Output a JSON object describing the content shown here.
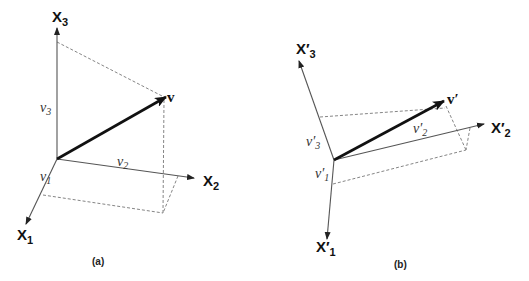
{
  "panel_a": {
    "caption": "(a)",
    "axes": {
      "x1": {
        "base": "X",
        "sub": "1"
      },
      "x2": {
        "base": "X",
        "sub": "2"
      },
      "x3": {
        "base": "X",
        "sub": "3"
      }
    },
    "vector": {
      "label": "v"
    },
    "components": {
      "v1": {
        "base": "v",
        "sub": "1"
      },
      "v2": {
        "base": "v",
        "sub": "2"
      },
      "v3": {
        "base": "v",
        "sub": "3"
      }
    }
  },
  "panel_b": {
    "caption": "(b)",
    "axes": {
      "x1": {
        "base": "X′",
        "sub": "1"
      },
      "x2": {
        "base": "X′",
        "sub": "2"
      },
      "x3": {
        "base": "X′",
        "sub": "3"
      }
    },
    "vector": {
      "label": "v′"
    },
    "components": {
      "v1": {
        "base": "v′",
        "sub": "1"
      },
      "v2": {
        "base": "v′",
        "sub": "2"
      },
      "v3": {
        "base": "v′",
        "sub": "3"
      }
    }
  },
  "colors": {
    "axis": "#555555",
    "vector": "#111111",
    "dashed": "#777777"
  }
}
